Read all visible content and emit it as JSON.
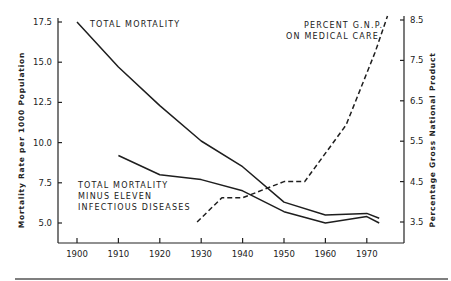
{
  "chart_data": {
    "type": "line",
    "title": "",
    "xlabel": "",
    "ylabel": "Mortality Rate per 1000 Population",
    "y2label": "Percentage Gross National Product",
    "xlim": [
      1895,
      1980
    ],
    "ylim": [
      3.75,
      17.5
    ],
    "y2lim": [
      3.0,
      8.5
    ],
    "x_ticks": [
      "1900",
      "1910",
      "1920",
      "1930",
      "1940",
      "1950",
      "1960",
      "1970"
    ],
    "y_ticks": [
      "17.5",
      "15.0",
      "12.5",
      "10.0",
      "7.5",
      "5.0"
    ],
    "y2_ticks": [
      "8.5",
      "7.5",
      "6.5",
      "5.5",
      "4.5",
      "3.5"
    ],
    "grid": false,
    "legend": "inline annotations",
    "series": [
      {
        "name": "TOTAL MORTALITY",
        "axis": "left",
        "style": "solid",
        "x": [
          1900,
          1910,
          1920,
          1930,
          1940,
          1950,
          1960,
          1970,
          1973
        ],
        "values": [
          17.5,
          14.7,
          12.3,
          10.1,
          8.5,
          6.3,
          5.5,
          5.6,
          5.3
        ]
      },
      {
        "name": "TOTAL MORTALITY MINUS ELEVEN INFECTIOUS DISEASES",
        "axis": "left",
        "style": "solid",
        "x": [
          1910,
          1920,
          1930,
          1940,
          1950,
          1960,
          1970,
          1973
        ],
        "values": [
          9.2,
          8.0,
          7.7,
          7.0,
          5.7,
          5.0,
          5.4,
          5.0
        ]
      },
      {
        "name": "PERCENT G.N.P. ON MEDICAL CARE",
        "axis": "right",
        "style": "dashed",
        "x": [
          1929,
          1935,
          1940,
          1950,
          1955,
          1965,
          1972,
          1975
        ],
        "values": [
          3.5,
          4.1,
          4.1,
          4.5,
          4.5,
          5.9,
          7.7,
          8.6
        ]
      }
    ]
  },
  "annotations": {
    "total_mortality": "TOTAL MORTALITY",
    "minus_line1": "TOTAL MORTALITY",
    "minus_line2": "MINUS ELEVEN",
    "minus_line3": "INFECTIOUS DISEASES",
    "gnp_line1": "PERCENT G.N.P.",
    "gnp_line2": "ON MEDICAL CARE"
  },
  "axes": {
    "left_title": "Mortality Rate per 1000 Population",
    "right_title": "Percentage Gross National Product"
  }
}
